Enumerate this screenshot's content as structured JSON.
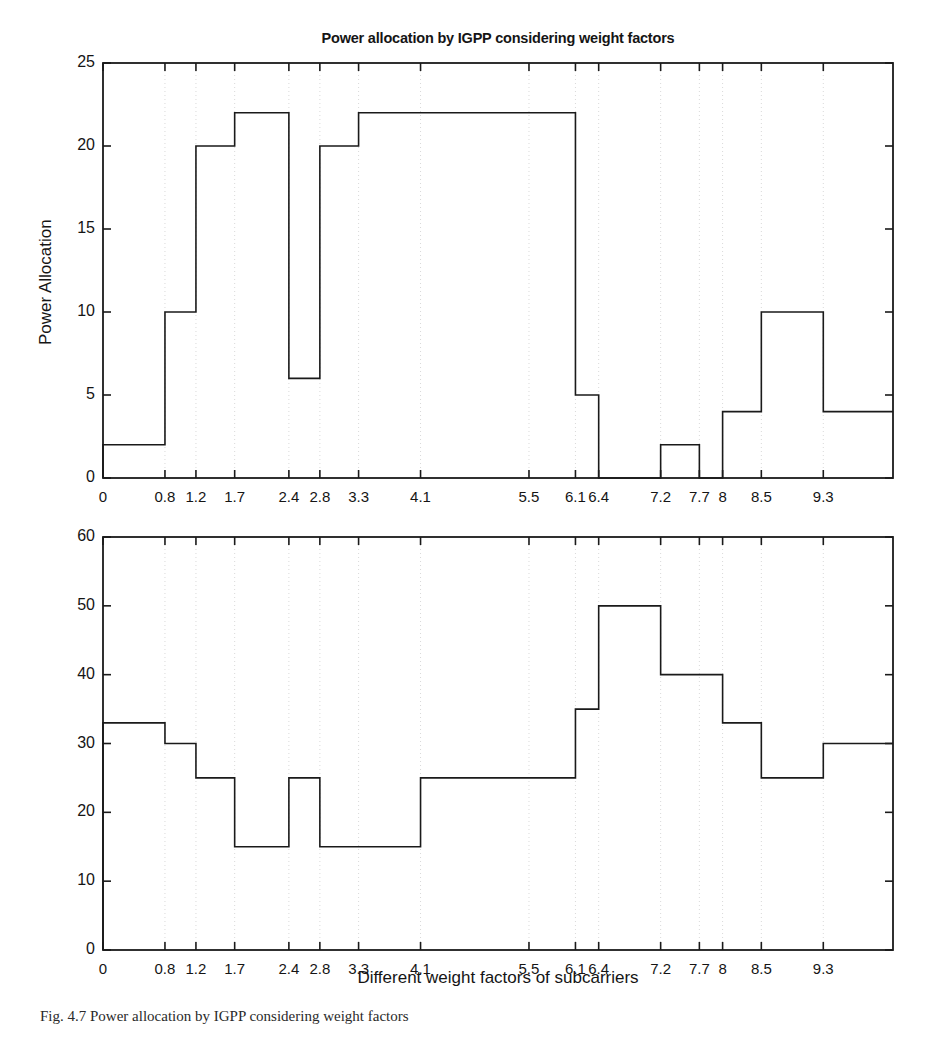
{
  "figure": {
    "width": 935,
    "height": 1042,
    "background": "#ffffff",
    "line_color": "#1a1a1a",
    "grid_color": "#d9d9d9",
    "caption": "Fig. 4.7  Power allocation by IGPP considering weight factors"
  },
  "chart_data": [
    {
      "type": "bar",
      "id": "power-allocation",
      "title": "Power allocation by IGPP considering weight factors",
      "xlabel": "",
      "ylabel": "Power Allocation",
      "xlim": [
        0,
        10.2
      ],
      "ylim": [
        0,
        25
      ],
      "yticks": [
        0,
        5,
        10,
        15,
        20,
        25
      ],
      "ytick_labels": [
        "0",
        "5",
        "10",
        "15",
        "20",
        "25"
      ],
      "xticks": [
        0,
        0.8,
        1.2,
        1.7,
        2.4,
        2.8,
        3.3,
        4.1,
        5.5,
        6.1,
        6.4,
        7.2,
        7.7,
        8,
        8.5,
        9.3
      ],
      "xtick_labels": [
        "0",
        "0.8",
        "1.2",
        "1.7",
        "2.4",
        "2.8",
        "3.3",
        "4.1",
        "5.5",
        "6.1",
        "6.4",
        "7.2",
        "7.7",
        "8",
        "8.5",
        "9.3"
      ],
      "grid": true,
      "legend": null,
      "bin_edges": [
        0,
        0.8,
        1.2,
        1.7,
        2.4,
        2.8,
        3.3,
        4.1,
        5.5,
        6.1,
        6.4,
        7.2,
        7.7,
        8,
        8.5,
        9.3,
        10.2
      ],
      "values": [
        2,
        10,
        20,
        22,
        6,
        20,
        22,
        22,
        22,
        5,
        0,
        2,
        0,
        4,
        10,
        4,
        4
      ]
    },
    {
      "type": "bar",
      "id": "noise-power",
      "title": "",
      "xlabel": "Different weight factors of subcarriers",
      "ylabel": "Noise Power",
      "xlim": [
        0,
        10.2
      ],
      "ylim": [
        0,
        60
      ],
      "yticks": [
        0,
        10,
        20,
        30,
        40,
        50,
        60
      ],
      "ytick_labels": [
        "0",
        "10",
        "20",
        "30",
        "40",
        "50",
        "60"
      ],
      "xticks": [
        0,
        0.8,
        1.2,
        1.7,
        2.4,
        2.8,
        3.3,
        4.1,
        5.5,
        6.1,
        6.4,
        7.2,
        7.7,
        8,
        8.5,
        9.3
      ],
      "xtick_labels": [
        "0",
        "0.8",
        "1.2",
        "1.7",
        "2.4",
        "2.8",
        "3.3",
        "4.1",
        "5.5",
        "6.1",
        "6.4",
        "7.2",
        "7.7",
        "8",
        "8.5",
        "9.3"
      ],
      "grid": true,
      "legend": null,
      "bin_edges": [
        0,
        0.8,
        1.2,
        1.7,
        2.4,
        2.8,
        3.3,
        4.1,
        5.5,
        6.1,
        6.4,
        7.2,
        7.7,
        8,
        8.5,
        9.3,
        10.2
      ],
      "values": [
        33,
        30,
        25,
        15,
        25,
        15,
        15,
        25,
        25,
        35,
        50,
        40,
        40,
        33,
        25,
        30,
        30
      ]
    }
  ]
}
